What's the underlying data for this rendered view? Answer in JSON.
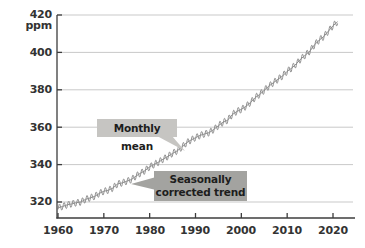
{
  "page": {
    "background": "#ffffff"
  },
  "chart_data": {
    "type": "line",
    "title": "",
    "unit_label": "ppm",
    "ytick_labels": [
      "420 ppm",
      "400",
      "380",
      "360",
      "340",
      "320"
    ],
    "ytick_values": [
      420,
      400,
      380,
      360,
      340,
      320
    ],
    "xtick_labels": [
      "1960",
      "1970",
      "1980",
      "1990",
      "2000",
      "2010",
      "2020"
    ],
    "xtick_values": [
      1960,
      1970,
      1980,
      1990,
      2000,
      2010,
      2020
    ],
    "xlim": [
      1959.8,
      2024.6
    ],
    "ylim": [
      310.5,
      420
    ],
    "grid": "horizontal",
    "legend": "none",
    "series": [
      {
        "name": "Seasonally corrected trend",
        "x": [
          1960,
          1961,
          1962,
          1963,
          1964,
          1965,
          1966,
          1967,
          1968,
          1969,
          1970,
          1971,
          1972,
          1973,
          1974,
          1975,
          1976,
          1977,
          1978,
          1979,
          1980,
          1981,
          1982,
          1983,
          1984,
          1985,
          1986,
          1987,
          1988,
          1989,
          1990,
          1991,
          1992,
          1993,
          1994,
          1995,
          1996,
          1997,
          1998,
          1999,
          2000,
          2001,
          2002,
          2003,
          2004,
          2005,
          2006,
          2007,
          2008,
          2009,
          2010,
          2011,
          2012,
          2013,
          2014,
          2015,
          2016,
          2017,
          2018,
          2019,
          2020,
          2021
        ],
        "values": [
          316.9,
          317.6,
          318.5,
          319.0,
          319.6,
          320.0,
          321.4,
          322.2,
          323.0,
          324.6,
          325.7,
          326.3,
          327.5,
          329.7,
          330.2,
          331.1,
          332.0,
          333.8,
          335.4,
          336.8,
          338.8,
          340.1,
          341.4,
          343.0,
          344.4,
          346.0,
          347.4,
          349.2,
          351.6,
          353.1,
          354.4,
          355.6,
          356.4,
          357.1,
          358.8,
          360.8,
          362.6,
          363.7,
          366.7,
          368.4,
          369.5,
          371.1,
          373.2,
          375.8,
          377.5,
          379.8,
          381.9,
          383.8,
          385.6,
          387.4,
          389.9,
          391.6,
          393.9,
          396.5,
          398.6,
          400.8,
          404.2,
          406.6,
          408.5,
          411.4,
          414.2,
          416.4
        ]
      },
      {
        "name": "Monthly mean",
        "derived_from": "Seasonally corrected trend",
        "seasonal_amplitude_ppm": 1.8,
        "samples_per_year": 12
      }
    ],
    "annotations": [
      {
        "label": "Monthly mean",
        "style": "light",
        "points_to": {
          "year": 1988,
          "ppm": 350
        }
      },
      {
        "label": "Seasonally corrected trend",
        "style": "dark",
        "points_to": {
          "year": 1976,
          "ppm": 332
        }
      }
    ],
    "colors": {
      "line": "#8f8f8f",
      "grid": "#c9c9c9",
      "axis": "#3c3c3c",
      "tick_text": "#333333",
      "annotation_light_bg": "#c6c5c2",
      "annotation_dark_bg": "#a3a3a0",
      "annotation_text": "#1d1d1d",
      "background": "#ffffff"
    }
  }
}
